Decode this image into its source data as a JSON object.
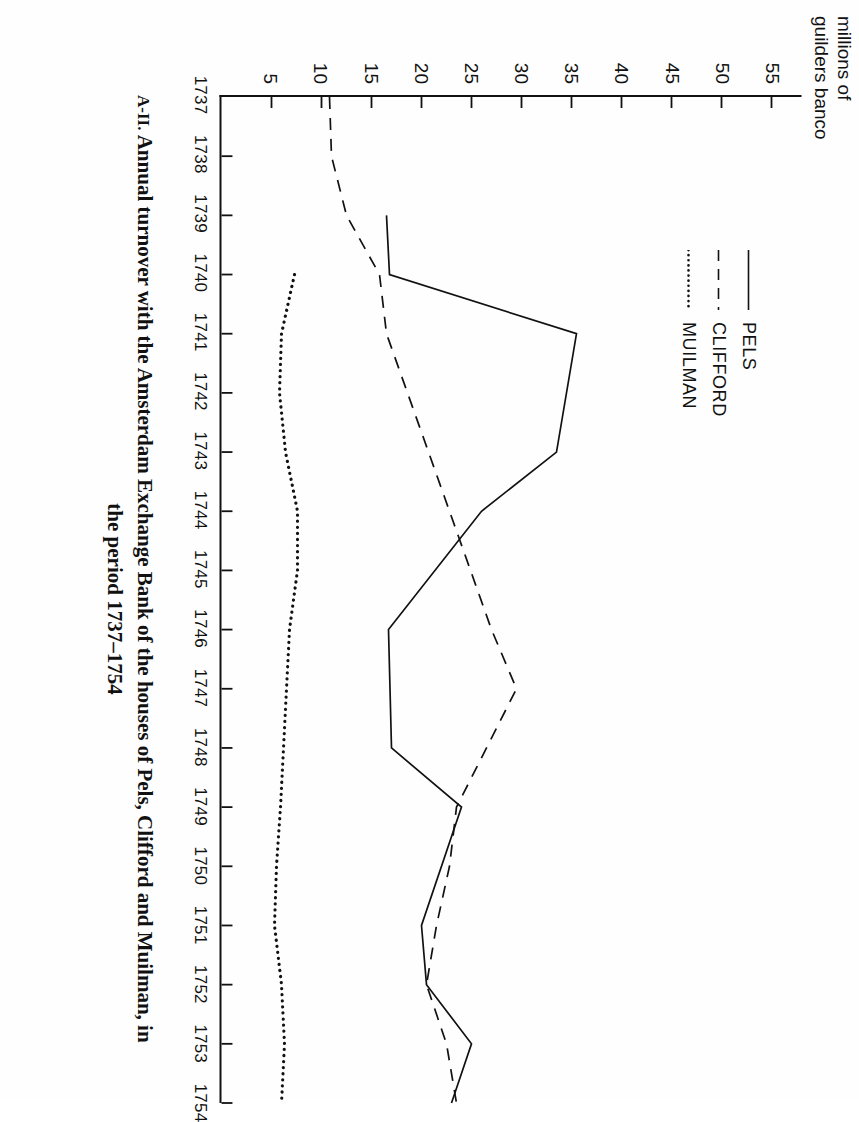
{
  "caption": {
    "number": "A-II. ",
    "line1": "Annual turnover with the Amsterdam Exchange Bank of the houses of Pels, Clifford and Muilman, in",
    "line2": "the period 1737–1754"
  },
  "chart_data": {
    "type": "line",
    "title": "",
    "xlabel": "",
    "ylabel": "millions of\nguilders banco",
    "x": [
      1737,
      1738,
      1739,
      1740,
      1741,
      1742,
      1743,
      1744,
      1745,
      1746,
      1747,
      1748,
      1749,
      1750,
      1751,
      1752,
      1753,
      1754
    ],
    "xticklabels": [
      "1737",
      "1738",
      "1739",
      "1740",
      "1741",
      "1742",
      "1743",
      "1744",
      "1745",
      "1746",
      "1747",
      "1748",
      "1749",
      "1750",
      "1751",
      "1752",
      "1753",
      "1754"
    ],
    "yticks": [
      5,
      10,
      15,
      20,
      25,
      30,
      35,
      40,
      45,
      50,
      55
    ],
    "yticklabels": [
      "5",
      "10",
      "15",
      "20",
      "25",
      "30",
      "35",
      "40",
      "45",
      "50",
      "55"
    ],
    "ylim": [
      0,
      58
    ],
    "xlim": [
      1737,
      1754
    ],
    "grid": false,
    "legend_position": "upper-left",
    "series": [
      {
        "name": "PELS",
        "style": "solid",
        "color": "#111111",
        "x": [
          1739,
          1740,
          1741,
          1743,
          1744,
          1746,
          1748,
          1749,
          1751,
          1752,
          1753,
          1754
        ],
        "values": [
          16.5,
          16.8,
          35.5,
          33.5,
          26.0,
          16.7,
          17.0,
          24.0,
          20.0,
          20.5,
          25.0,
          23.0
        ]
      },
      {
        "name": "CLIFFORD",
        "style": "dashed",
        "color": "#111111",
        "x": [
          1737,
          1738,
          1739,
          1740,
          1741,
          1746,
          1747,
          1748,
          1749,
          1750,
          1751,
          1752,
          1753,
          1754
        ],
        "values": [
          10.8,
          11.0,
          12.5,
          15.8,
          16.5,
          27.0,
          29.5,
          26.5,
          23.5,
          22.8,
          21.5,
          20.5,
          22.5,
          23.5
        ]
      },
      {
        "name": "MUILMAN",
        "style": "dotted",
        "color": "#111111",
        "x": [
          1740,
          1741,
          1742,
          1743,
          1744,
          1745,
          1746,
          1747,
          1748,
          1749,
          1750,
          1751,
          1752,
          1753,
          1754
        ],
        "values": [
          7.3,
          6.0,
          5.8,
          6.4,
          7.6,
          7.6,
          6.8,
          6.5,
          6.2,
          5.9,
          5.5,
          5.3,
          6.0,
          6.3,
          6.0
        ]
      }
    ]
  }
}
